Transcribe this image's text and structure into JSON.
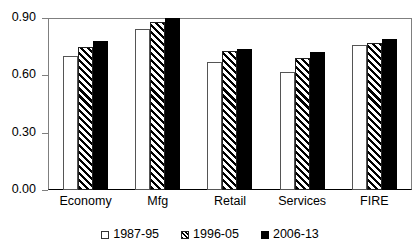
{
  "chart_data": {
    "type": "bar",
    "title": "",
    "subtitle": "",
    "xlabel": "",
    "ylabel": "",
    "categories": [
      "Economy",
      "Mfg",
      "Retail",
      "Services",
      "FIRE"
    ],
    "series": [
      {
        "name": "1987-95",
        "fill": "open-white",
        "values": [
          0.7,
          0.84,
          0.67,
          0.62,
          0.76
        ]
      },
      {
        "name": "1996-05",
        "fill": "diagonal-hatch",
        "values": [
          0.75,
          0.88,
          0.73,
          0.69,
          0.77
        ]
      },
      {
        "name": "2006-13",
        "fill": "solid-black",
        "values": [
          0.78,
          0.9,
          0.74,
          0.72,
          0.79
        ]
      }
    ],
    "ylim": [
      0.0,
      0.9
    ],
    "yticks": [
      "0.00",
      "0.30",
      "0.60",
      "0.90"
    ],
    "ytick_values": [
      0.0,
      0.3,
      0.6,
      0.9
    ],
    "grid": false,
    "legend_position": "bottom-center",
    "colors": {
      "series_1987_95": "#ffffff",
      "series_1996_05": "#000000",
      "series_2006_13": "#000000",
      "axis": "#7f7f7f",
      "text": "#000000",
      "background": "#ffffff"
    }
  },
  "legend": {
    "items": [
      {
        "label": "1987-95"
      },
      {
        "label": "1996-05"
      },
      {
        "label": "2006-13"
      }
    ]
  }
}
